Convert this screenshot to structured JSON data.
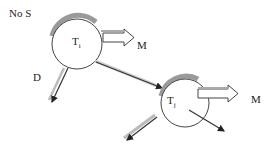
{
  "diagram": {
    "corner_label": "No S",
    "nodes": [
      {
        "id": "Ti",
        "label": "T",
        "sub": "i"
      },
      {
        "id": "Tj",
        "label": "T",
        "sub": "j"
      }
    ],
    "edge_labels": {
      "down_arrow": "D",
      "ti_out_arrow": "M",
      "tj_out_arrow": "M"
    },
    "colors": {
      "stroke": "#333333",
      "shadow": "#9a9a9a",
      "fill": "#ffffff"
    }
  }
}
